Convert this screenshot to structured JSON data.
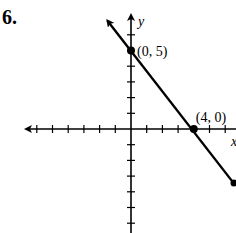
{
  "problem": {
    "number": "6."
  },
  "chart_data": {
    "type": "line",
    "title": "",
    "xlabel": "x",
    "ylabel": "y",
    "xlim": [
      -6.5,
      6.5
    ],
    "ylim": [
      -6.5,
      7
    ],
    "grid": false,
    "tick_spacing": 1,
    "series": [
      {
        "name": "line",
        "x": [
          -1.5,
          6.5
        ],
        "y": [
          6.9,
          -3.4
        ],
        "equation": "y = -5/4 x + 5",
        "color": "#000000"
      }
    ],
    "points": [
      {
        "x": 0,
        "y": 5,
        "label": "(0, 5)"
      },
      {
        "x": 4,
        "y": 0,
        "label": "(4, 0)"
      }
    ]
  }
}
